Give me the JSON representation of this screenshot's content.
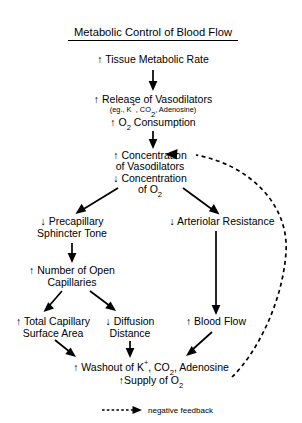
{
  "title": "Metabolic Control of Blood Flow",
  "legend": {
    "label": "negative feedback",
    "icon": "dashed-arrow-icon"
  },
  "colors": {
    "ink": "#000000",
    "background": "#ffffff"
  },
  "arrows": {
    "up": "↑",
    "down": "↓"
  },
  "nodes": {
    "tissue_metabolic_rate": {
      "line1": "↑ Tissue Metabolic Rate"
    },
    "release_vasodilators": {
      "line1": "↑ Release of Vasodilators",
      "line2_prefix": "(eg., K",
      "line2_sup1": "+",
      "line2_mid": ", CO",
      "line2_sub1": "2",
      "line2_suffix": ", Adenosine)",
      "line3_prefix": "↑ O",
      "line3_sub": "2",
      "line3_suffix": " Consumption"
    },
    "concentration_block": {
      "line1": "↑ Concentration",
      "line2": "of Vasodilators",
      "line3": "↓ Concentration",
      "line4_prefix": "of O",
      "line4_sub": "2"
    },
    "precapillary_sphincter_tone": {
      "line1": "↓ Precapillary",
      "line2": "Sphincter Tone"
    },
    "arteriolar_resistance": {
      "line1": "↓ Arteriolar Resistance"
    },
    "number_open_capillaries": {
      "line1": "↑ Number of Open",
      "line2": "Capillaries"
    },
    "total_capillary_surface_area": {
      "line1": "↑ Total Capillary",
      "line2": "Surface Area"
    },
    "diffusion_distance": {
      "line1": "↓ Diffusion",
      "line2": "Distance"
    },
    "blood_flow": {
      "line1": "↑ Blood Flow"
    },
    "washout_supply": {
      "line1_prefix": "↑ Washout of K",
      "line1_sup": "+",
      "line1_mid": ", CO",
      "line1_sub": "2",
      "line1_suffix": ", Adenosine",
      "line2_prefix": "↑Supply of O",
      "line2_sub": "2"
    }
  }
}
